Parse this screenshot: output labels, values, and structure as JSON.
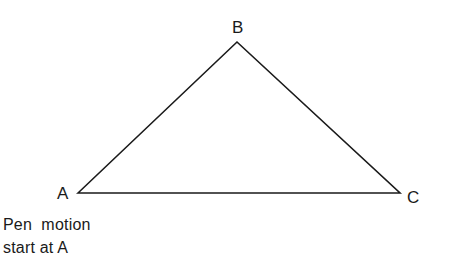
{
  "diagram": {
    "type": "triangle",
    "stroke_color": "#1a1a1a",
    "background": "#ffffff",
    "vertices": [
      {
        "label": "A",
        "x": 78,
        "y": 193
      },
      {
        "label": "B",
        "x": 237,
        "y": 42
      },
      {
        "label": "C",
        "x": 400,
        "y": 193
      }
    ],
    "labels": {
      "a": "A",
      "b": "B",
      "c": "C"
    },
    "caption": {
      "line1": "Pen  motion",
      "line2": "start at A"
    }
  }
}
